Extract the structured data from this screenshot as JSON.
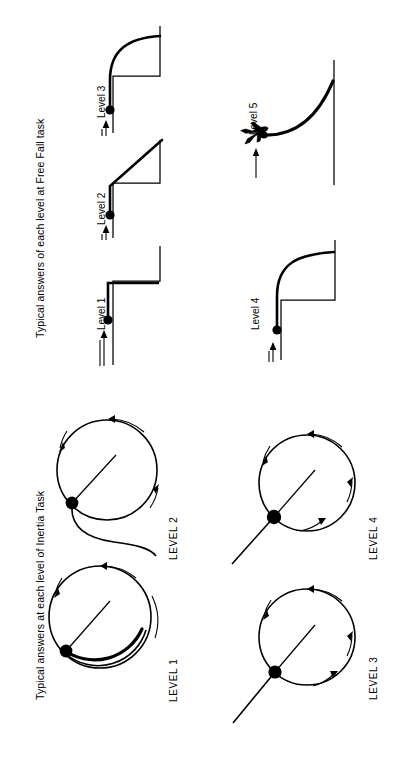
{
  "figure": {
    "orientation": "rotated-90-ccw",
    "background_color": "#ffffff",
    "ink_color": "#000000"
  },
  "panels": [
    {
      "id": "free-fall",
      "title": "Typical answers of each level at Free Fall task",
      "task_name": "Free Fall task",
      "items": [
        {
          "label": "Level 1",
          "answer_type": "horizontal-then-vertical-drop",
          "description": "ball travels straight horizontally along the table then drops straight down at the edge",
          "has_ball": true,
          "has_motion_arrow": true
        },
        {
          "label": "Level 2",
          "answer_type": "straight-diagonal",
          "description": "ball leaves the edge and travels along a straight diagonal line downward",
          "has_ball": true,
          "has_motion_arrow": true
        },
        {
          "label": "Level 3",
          "answer_type": "curved-shallow",
          "description": "ball follows a rounded curve from the edge down to the floor",
          "has_ball": true,
          "has_motion_arrow": true
        },
        {
          "label": "Level 4",
          "answer_type": "curved-parabolic",
          "description": "ball follows a smooth parabolic curve away from the table edge",
          "has_ball": true,
          "has_motion_arrow": true
        },
        {
          "label": "Level 5",
          "answer_type": "parabolic-from-aircraft",
          "description": "object released from a moving aircraft follows a parabolic path to the ground",
          "has_ball": true,
          "has_motion_arrow": true,
          "has_aircraft": true
        }
      ]
    },
    {
      "id": "inertia",
      "title": "Typical answers at each level of Inertia Task",
      "task_name": "Inertia Task",
      "items": [
        {
          "label": "LEVEL 1",
          "answer_type": "continues-circular",
          "description": "object keeps moving on a circular path after leaving the circle",
          "has_ball": true,
          "has_radius_line": true,
          "rotation_arrows": 3
        },
        {
          "label": "LEVEL 2",
          "answer_type": "curved-spiral-outward",
          "description": "object follows a curved spiralling path that gradually straightens",
          "has_ball": true,
          "has_radius_line": true,
          "rotation_arrows": 3
        },
        {
          "label": "LEVEL 3",
          "answer_type": "straight-radial",
          "description": "object moves off along a straight line directed outward from the centre",
          "has_ball": true,
          "has_radius_line": true,
          "rotation_arrows": 4
        },
        {
          "label": "LEVEL 4",
          "answer_type": "straight-tangential",
          "description": "object moves off along the straight tangent to the circle",
          "has_ball": true,
          "has_radius_line": true,
          "rotation_arrows": 4
        }
      ]
    }
  ]
}
